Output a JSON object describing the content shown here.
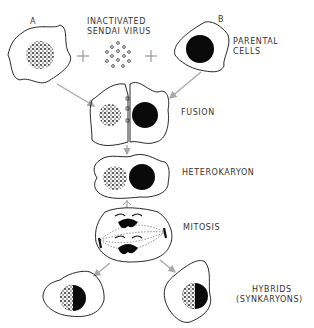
{
  "labels": {
    "cell_a": "A",
    "cell_b": "B",
    "virus_line1": "INACTIVATED",
    "virus_line2": "SENDAI VIRUS",
    "parental_line1": "PARENTAL",
    "parental_line2": "CELLS",
    "fusion": "FUSION",
    "heterokaryon": "HETEROKARYON",
    "mitosis": "MITOSIS",
    "hybrids_line1": "HYBRIDS",
    "hybrids_line2": "(SYNKARYONS)",
    "plus": "+"
  },
  "colors": {
    "line": "#111111",
    "arrow": "#a8a8a8",
    "nucleus": "#0a0a0a"
  }
}
